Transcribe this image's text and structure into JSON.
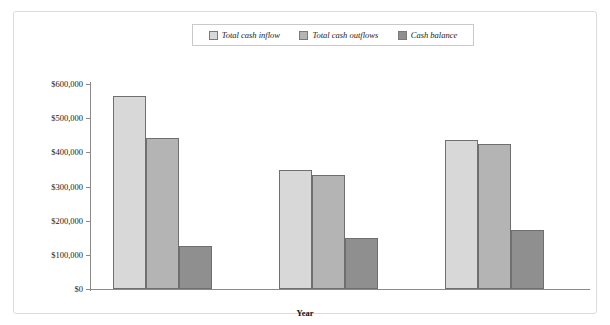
{
  "chart_data": {
    "type": "bar",
    "title": "",
    "xlabel": "Year",
    "ylabel": "",
    "categories": [
      "1",
      "2",
      "3"
    ],
    "series": [
      {
        "name": "Total cash inflow",
        "color": "#d8d8d8",
        "values": [
          565000,
          348000,
          437000
        ]
      },
      {
        "name": "Total cash outflows",
        "color": "#b4b4b4",
        "values": [
          442000,
          334000,
          424000
        ]
      },
      {
        "name": "Cash balance",
        "color": "#8f8f8f",
        "values": [
          126000,
          149000,
          173000
        ]
      }
    ],
    "ylim": [
      0,
      600000
    ],
    "ytick_values": [
      0,
      100000,
      200000,
      300000,
      400000,
      500000,
      600000
    ],
    "ytick_labels": [
      "$0",
      "$100,000",
      "$200,000",
      "$300,000",
      "$400,000",
      "$500,000",
      "$600,000"
    ],
    "grid": false,
    "legend_position": "top-center"
  },
  "legend": {
    "items": [
      {
        "label": "Total cash inflow",
        "swatch_color": "#d8d8d8"
      },
      {
        "label": "Total cash outflows",
        "swatch_color": "#b4b4b4"
      },
      {
        "label": "Cash balance",
        "swatch_color": "#8f8f8f"
      }
    ]
  },
  "axes": {
    "x_title": "Year"
  },
  "colors": {
    "frame_border": "#dcdcdc",
    "axis_line": "#8a8a8a",
    "bar_border": "#6f6f6f",
    "text": "#1a1a1a"
  }
}
